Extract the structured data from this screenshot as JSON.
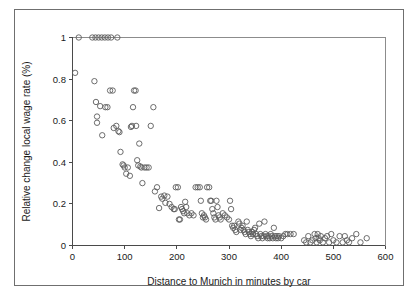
{
  "figure": {
    "background_color": "#ffffff",
    "frame_color": "#6f6f6f",
    "marker_color": "#5c5c5c",
    "axis_color": "#4a4a4a"
  },
  "chart_data": {
    "type": "scatter",
    "title": "",
    "subtitle": "",
    "xlabel": "Distance to Munich in minutes by car",
    "ylabel": "Relative change local wage rate (%)",
    "xlim": [
      0,
      600
    ],
    "ylim": [
      0,
      1
    ],
    "xticks": [
      0,
      100,
      200,
      300,
      400,
      500,
      600
    ],
    "xtick_labels": [
      "0",
      "100",
      "200",
      "300",
      "400",
      "500",
      "600"
    ],
    "yticks": [
      0,
      0.2,
      0.4,
      0.6,
      0.8,
      1
    ],
    "ytick_labels": [
      "0",
      "0.2",
      "0.4",
      "0.6",
      "0.8",
      "1"
    ],
    "grid": false,
    "legend": null,
    "marker_style": "open-circle",
    "marker_size_px": 5.4,
    "annotations": [],
    "series": [
      {
        "name": "Municipalities",
        "points": [
          [
            5,
            0.83
          ],
          [
            12,
            1.0
          ],
          [
            38,
            1.0
          ],
          [
            44,
            1.0
          ],
          [
            50,
            1.0
          ],
          [
            56,
            1.0
          ],
          [
            62,
            1.0
          ],
          [
            68,
            1.0
          ],
          [
            74,
            1.0
          ],
          [
            86,
            1.0
          ],
          [
            42,
            0.79
          ],
          [
            45,
            0.69
          ],
          [
            47,
            0.62
          ],
          [
            47,
            0.59
          ],
          [
            53,
            0.67
          ],
          [
            57,
            0.53
          ],
          [
            63,
            0.665
          ],
          [
            67,
            0.665
          ],
          [
            72,
            0.745
          ],
          [
            77,
            0.745
          ],
          [
            79,
            0.565
          ],
          [
            84,
            0.575
          ],
          [
            88,
            0.55
          ],
          [
            90,
            0.545
          ],
          [
            92,
            0.45
          ],
          [
            96,
            0.39
          ],
          [
            98,
            0.385
          ],
          [
            100,
            0.375
          ],
          [
            103,
            0.345
          ],
          [
            106,
            0.375
          ],
          [
            110,
            0.335
          ],
          [
            112,
            0.57
          ],
          [
            114,
            0.575
          ],
          [
            116,
            0.665
          ],
          [
            118,
            0.745
          ],
          [
            121,
            0.745
          ],
          [
            122,
            0.575
          ],
          [
            124,
            0.41
          ],
          [
            126,
            0.385
          ],
          [
            128,
            0.49
          ],
          [
            130,
            0.38
          ],
          [
            132,
            0.375
          ],
          [
            134,
            0.3
          ],
          [
            138,
            0.375
          ],
          [
            142,
            0.375
          ],
          [
            146,
            0.375
          ],
          [
            150,
            0.575
          ],
          [
            155,
            0.665
          ],
          [
            158,
            0.26
          ],
          [
            162,
            0.28
          ],
          [
            166,
            0.18
          ],
          [
            170,
            0.235
          ],
          [
            172,
            0.225
          ],
          [
            176,
            0.24
          ],
          [
            178,
            0.205
          ],
          [
            182,
            0.235
          ],
          [
            186,
            0.2
          ],
          [
            190,
            0.185
          ],
          [
            194,
            0.175
          ],
          [
            196,
            0.175
          ],
          [
            198,
            0.28
          ],
          [
            202,
            0.28
          ],
          [
            204,
            0.125
          ],
          [
            206,
            0.125
          ],
          [
            208,
            0.185
          ],
          [
            210,
            0.175
          ],
          [
            212,
            0.165
          ],
          [
            214,
            0.155
          ],
          [
            216,
            0.21
          ],
          [
            218,
            0.185
          ],
          [
            220,
            0.155
          ],
          [
            224,
            0.145
          ],
          [
            228,
            0.155
          ],
          [
            232,
            0.145
          ],
          [
            236,
            0.28
          ],
          [
            240,
            0.28
          ],
          [
            244,
            0.28
          ],
          [
            246,
            0.215
          ],
          [
            248,
            0.155
          ],
          [
            250,
            0.135
          ],
          [
            252,
            0.145
          ],
          [
            254,
            0.135
          ],
          [
            256,
            0.125
          ],
          [
            258,
            0.28
          ],
          [
            262,
            0.28
          ],
          [
            264,
            0.215
          ],
          [
            266,
            0.215
          ],
          [
            268,
            0.175
          ],
          [
            270,
            0.155
          ],
          [
            272,
            0.135
          ],
          [
            274,
            0.125
          ],
          [
            276,
            0.215
          ],
          [
            278,
            0.185
          ],
          [
            280,
            0.145
          ],
          [
            282,
            0.135
          ],
          [
            284,
            0.125
          ],
          [
            288,
            0.155
          ],
          [
            292,
            0.145
          ],
          [
            296,
            0.135
          ],
          [
            300,
            0.125
          ],
          [
            302,
            0.215
          ],
          [
            304,
            0.175
          ],
          [
            306,
            0.095
          ],
          [
            308,
            0.085
          ],
          [
            310,
            0.095
          ],
          [
            312,
            0.075
          ],
          [
            314,
            0.065
          ],
          [
            318,
            0.115
          ],
          [
            320,
            0.105
          ],
          [
            322,
            0.075
          ],
          [
            324,
            0.085
          ],
          [
            326,
            0.095
          ],
          [
            328,
            0.075
          ],
          [
            330,
            0.065
          ],
          [
            332,
            0.055
          ],
          [
            334,
            0.115
          ],
          [
            336,
            0.075
          ],
          [
            338,
            0.065
          ],
          [
            340,
            0.055
          ],
          [
            342,
            0.045
          ],
          [
            344,
            0.065
          ],
          [
            346,
            0.055
          ],
          [
            348,
            0.075
          ],
          [
            350,
            0.085
          ],
          [
            352,
            0.055
          ],
          [
            354,
            0.045
          ],
          [
            356,
            0.035
          ],
          [
            358,
            0.105
          ],
          [
            360,
            0.055
          ],
          [
            362,
            0.045
          ],
          [
            364,
            0.035
          ],
          [
            366,
            0.045
          ],
          [
            368,
            0.115
          ],
          [
            370,
            0.055
          ],
          [
            372,
            0.045
          ],
          [
            374,
            0.035
          ],
          [
            376,
            0.045
          ],
          [
            378,
            0.035
          ],
          [
            380,
            0.055
          ],
          [
            382,
            0.045
          ],
          [
            384,
            0.035
          ],
          [
            386,
            0.085
          ],
          [
            388,
            0.045
          ],
          [
            390,
            0.035
          ],
          [
            392,
            0.045
          ],
          [
            394,
            0.035
          ],
          [
            396,
            0.045
          ],
          [
            400,
            0.035
          ],
          [
            404,
            0.045
          ],
          [
            408,
            0.055
          ],
          [
            412,
            0.055
          ],
          [
            418,
            0.055
          ],
          [
            424,
            0.055
          ],
          [
            444,
            0.025
          ],
          [
            448,
            0.015
          ],
          [
            452,
            0.045
          ],
          [
            456,
            0.015
          ],
          [
            460,
            0.025
          ],
          [
            464,
            0.055
          ],
          [
            466,
            0.035
          ],
          [
            468,
            0.015
          ],
          [
            470,
            0.055
          ],
          [
            472,
            0.035
          ],
          [
            474,
            0.025
          ],
          [
            476,
            0.045
          ],
          [
            480,
            0.015
          ],
          [
            484,
            0.035
          ],
          [
            488,
            0.045
          ],
          [
            492,
            0.015
          ],
          [
            496,
            0.055
          ],
          [
            500,
            0.025
          ],
          [
            506,
            0.015
          ],
          [
            512,
            0.045
          ],
          [
            518,
            0.015
          ],
          [
            522,
            0.045
          ],
          [
            526,
            0.025
          ],
          [
            530,
            0.015
          ],
          [
            536,
            0.035
          ],
          [
            544,
            0.055
          ],
          [
            552,
            0.015
          ],
          [
            564,
            0.035
          ]
        ]
      }
    ]
  }
}
